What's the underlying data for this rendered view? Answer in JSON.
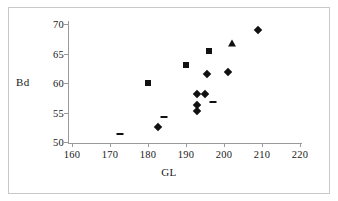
{
  "chart_data": {
    "type": "scatter",
    "title": "",
    "xlabel": "GL",
    "ylabel": "Bd",
    "xlim": [
      160,
      220
    ],
    "ylim": [
      50,
      70
    ],
    "xticks": [
      160,
      170,
      180,
      190,
      200,
      210,
      220
    ],
    "yticks": [
      50,
      55,
      60,
      65,
      70
    ],
    "grid": false,
    "legend": "none",
    "series": [
      {
        "name": "diamond",
        "marker": "diamond",
        "color": "#111111",
        "points": [
          [
            182.5,
            52.6
          ],
          [
            193.0,
            55.2
          ],
          [
            193.0,
            56.3
          ],
          [
            193.0,
            58.1
          ],
          [
            195.0,
            58.2
          ],
          [
            195.5,
            61.5
          ],
          [
            201.0,
            61.8
          ],
          [
            209.0,
            69.0
          ]
        ]
      },
      {
        "name": "square",
        "marker": "square",
        "color": "#111111",
        "points": [
          [
            180.0,
            60.0
          ],
          [
            190.0,
            63.1
          ],
          [
            196.0,
            65.4
          ]
        ]
      },
      {
        "name": "triangle",
        "marker": "triangle",
        "color": "#111111",
        "points": [
          [
            202.0,
            66.7
          ]
        ]
      },
      {
        "name": "dash",
        "marker": "dash",
        "color": "#111111",
        "points": [
          [
            172.5,
            51.4
          ],
          [
            184.3,
            54.2
          ],
          [
            197.0,
            56.8
          ]
        ]
      }
    ]
  },
  "axis": {
    "x_tick_labels": [
      "160",
      "170",
      "180",
      "190",
      "200",
      "210",
      "220"
    ],
    "y_tick_labels": [
      "50",
      "55",
      "60",
      "65",
      "70"
    ],
    "x_title": "GL",
    "y_title": "Bd"
  }
}
